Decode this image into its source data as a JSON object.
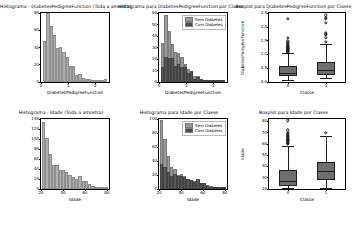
{
  "figure": {
    "background": "#ffffff",
    "colors": {
      "all": "#b0b0b0",
      "sem_diabetes": "#9a9a9a",
      "com_diabetes": "#4d4d4d",
      "box_fill": "#6e6e6e",
      "line": "#1f1f1f"
    }
  },
  "legend": {
    "sem_diabetes": "Sem Diabetes",
    "com_diabetes": "Com Diabetes"
  },
  "chart_data": [
    {
      "id": "dpf-hist-all",
      "type": "bar",
      "title": "Histograma - DiabetesPedigreeFunction (Toda a amostra)",
      "xlabel": "DiabetesPedigreeFunction",
      "ylabel": "",
      "xlim": [
        0.0,
        2.5
      ],
      "ylim": [
        0,
        80
      ],
      "xticks": [
        0,
        1,
        2
      ],
      "xticklabels": [
        "0",
        "1",
        "2"
      ],
      "yticks": [
        0,
        20,
        40,
        60,
        80
      ],
      "yticklabels": [
        "0",
        "20",
        "40",
        "60",
        "80"
      ],
      "grid": false,
      "bin_edges": [
        0.078,
        0.196,
        0.314,
        0.432,
        0.55,
        0.668,
        0.786,
        0.904,
        1.022,
        1.14,
        1.258,
        1.376,
        1.494,
        1.612,
        1.73,
        1.848,
        1.966,
        2.084,
        2.202,
        2.32,
        2.42
      ],
      "values": [
        47,
        80,
        65,
        54,
        40,
        41,
        35,
        29,
        19,
        19,
        8,
        9,
        5,
        4,
        4,
        2,
        2,
        1,
        1,
        3
      ]
    },
    {
      "id": "dpf-hist-class",
      "type": "bar",
      "title": "Histograma para DiabetesPedigreeFunction por Classe",
      "xlabel": "DiabetesPedigreeFunction",
      "ylabel": "",
      "xlim": [
        0.0,
        2.5
      ],
      "ylim": [
        0,
        60
      ],
      "xticks": [
        0,
        1,
        2
      ],
      "xticklabels": [
        "0",
        "1",
        "2"
      ],
      "yticks": [
        0,
        10,
        20,
        30,
        40,
        50,
        60
      ],
      "yticklabels": [
        "0",
        "10",
        "20",
        "30",
        "40",
        "50",
        "60"
      ],
      "grid": false,
      "bin_edges": [
        0.078,
        0.196,
        0.314,
        0.432,
        0.55,
        0.668,
        0.786,
        0.904,
        1.022,
        1.14,
        1.258,
        1.376,
        1.494,
        1.612,
        1.73,
        1.848,
        1.966,
        2.084,
        2.202,
        2.32,
        2.42
      ],
      "series": [
        {
          "name": "Sem Diabetes",
          "values": [
            34,
            58,
            44,
            33,
            26,
            25,
            22,
            16,
            11,
            9,
            5,
            5,
            2,
            2,
            2,
            1,
            1,
            0,
            0,
            1
          ]
        },
        {
          "name": "Com Diabetes",
          "values": [
            13,
            22,
            21,
            21,
            14,
            16,
            13,
            13,
            8,
            10,
            3,
            4,
            3,
            2,
            2,
            1,
            1,
            1,
            1,
            2
          ]
        }
      ]
    },
    {
      "id": "dpf-boxplot",
      "type": "box",
      "title": "Boxplot para DiabetesPedigreeFunction por Classe",
      "xlabel": "Classe",
      "ylabel": "DiabetesPedigreeFunction",
      "ylim": [
        0.0,
        2.5
      ],
      "yticks": [
        0.0,
        0.5,
        1.0,
        1.5,
        2.0,
        2.5
      ],
      "yticklabels": [
        "0.0",
        "0.5",
        "1.0",
        "1.5",
        "2.0",
        "2.5"
      ],
      "xticks": [
        0,
        1
      ],
      "xticklabels": [
        "0",
        "1"
      ],
      "grid": false,
      "boxes": [
        {
          "label": "0",
          "whisker_low": 0.078,
          "q1": 0.23,
          "median": 0.336,
          "q3": 0.562,
          "whisker_high": 1.057,
          "fliers": [
            1.076,
            1.095,
            1.114,
            1.136,
            1.154,
            1.189,
            1.191,
            1.213,
            1.222,
            1.251,
            1.282,
            1.292,
            1.318,
            1.353,
            1.39,
            1.441,
            1.476,
            1.6,
            2.288
          ]
        },
        {
          "label": "1",
          "whisker_low": 0.128,
          "q1": 0.263,
          "median": 0.449,
          "q3": 0.728,
          "whisker_high": 1.394,
          "fliers": [
            1.461,
            1.6,
            1.699,
            1.731,
            1.781,
            2.137,
            2.288,
            2.329,
            2.42
          ]
        }
      ]
    },
    {
      "id": "idade-hist-all",
      "type": "bar",
      "title": "Histograma - Idade (Toda a amostra)",
      "xlabel": "Idade",
      "ylabel": "",
      "xlim": [
        20,
        82
      ],
      "ylim": [
        0,
        140
      ],
      "xticks": [
        20,
        40,
        60,
        80
      ],
      "xticklabels": [
        "20",
        "40",
        "60",
        "80"
      ],
      "yticks": [
        0,
        20,
        40,
        60,
        80,
        100,
        120,
        140
      ],
      "yticklabels": [
        "0",
        "20",
        "40",
        "60",
        "80",
        "100",
        "120",
        "140"
      ],
      "grid": false,
      "bin_edges": [
        21,
        24,
        27,
        30,
        33,
        36,
        39,
        42,
        45,
        48,
        51,
        54,
        57,
        60,
        63,
        66,
        69,
        72,
        75,
        78,
        81
      ],
      "values": [
        135,
        103,
        71,
        49,
        49,
        38,
        39,
        35,
        28,
        25,
        21,
        27,
        17,
        17,
        10,
        6,
        3,
        1,
        1,
        2
      ]
    },
    {
      "id": "idade-hist-class",
      "type": "bar",
      "title": "Histograma para Idade por Classe",
      "xlabel": "Idade",
      "ylabel": "",
      "xlim": [
        20,
        82
      ],
      "ylim": [
        0,
        100
      ],
      "xticks": [
        20,
        40,
        60,
        80
      ],
      "xticklabels": [
        "20",
        "40",
        "60",
        "80"
      ],
      "yticks": [
        0,
        20,
        40,
        60,
        80,
        100
      ],
      "yticklabels": [
        "0",
        "20",
        "40",
        "60",
        "80",
        "100"
      ],
      "grid": false,
      "bin_edges": [
        21,
        24,
        27,
        30,
        33,
        36,
        39,
        42,
        45,
        48,
        51,
        54,
        57,
        60,
        63,
        66,
        69,
        72,
        75,
        78,
        81
      ],
      "series": [
        {
          "name": "Sem Diabetes",
          "values": [
            99,
            72,
            47,
            31,
            28,
            20,
            21,
            18,
            14,
            12,
            10,
            13,
            9,
            9,
            6,
            4,
            2,
            1,
            1,
            1
          ]
        },
        {
          "name": "Com Diabetes",
          "values": [
            36,
            31,
            24,
            18,
            21,
            18,
            18,
            17,
            14,
            13,
            11,
            14,
            8,
            8,
            4,
            2,
            1,
            0,
            0,
            1
          ]
        }
      ]
    },
    {
      "id": "idade-boxplot",
      "type": "box",
      "title": "Boxplot para Idade por Classe",
      "xlabel": "Classe",
      "ylabel": "Idade",
      "ylim": [
        20,
        82
      ],
      "yticks": [
        20,
        30,
        40,
        50,
        60,
        70,
        80
      ],
      "yticklabels": [
        "20",
        "30",
        "40",
        "50",
        "60",
        "70",
        "80"
      ],
      "xticks": [
        0,
        1
      ],
      "xticklabels": [
        "0",
        "1"
      ],
      "grid": false,
      "boxes": [
        {
          "label": "0",
          "whisker_low": 21,
          "q1": 23,
          "median": 27,
          "q3": 37,
          "whisker_high": 58,
          "fliers": [
            60,
            60,
            61,
            61,
            62,
            62,
            63,
            63,
            64,
            65,
            66,
            66,
            67,
            67,
            68,
            69,
            70,
            72,
            81
          ]
        },
        {
          "label": "1",
          "whisker_low": 21,
          "q1": 28,
          "median": 36,
          "q3": 44,
          "whisker_high": 67,
          "fliers": [
            70
          ]
        }
      ]
    }
  ]
}
